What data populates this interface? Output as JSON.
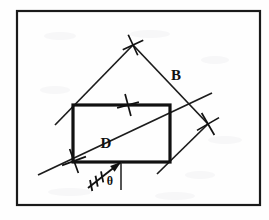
{
  "figure": {
    "background_color": "#fefefe",
    "ink_color": "#111111",
    "frame": {
      "name": "outer-border",
      "x": 17,
      "y": 11,
      "width": 243,
      "height": 194
    },
    "labels": [
      {
        "id": "B",
        "text": "B",
        "x": 176,
        "y": 80,
        "role": "diamond-side-label"
      },
      {
        "id": "D",
        "text": "D",
        "x": 106,
        "y": 148,
        "role": "rectangle-diagonal-label"
      },
      {
        "id": "theta",
        "text": "θ",
        "x": 110,
        "y": 185,
        "role": "angle-label"
      }
    ],
    "rectangle": {
      "name": "solid-rectangle",
      "x": 73,
      "y": 105,
      "width": 97,
      "height": 57,
      "stroke_width": 3.2
    },
    "diamond": {
      "name": "diamond-outline",
      "top_vertex": {
        "x": 133,
        "y": 45
      },
      "right_vertex": {
        "x": 208,
        "y": 124
      },
      "left_end": {
        "x": 55,
        "y": 125
      },
      "bottom_end": {
        "x": 157,
        "y": 174
      }
    },
    "diagonal": {
      "name": "rectangle-diagonal",
      "start": {
        "x": 38,
        "y": 175
      },
      "end": {
        "x": 212,
        "y": 93
      }
    },
    "x_marks": [
      {
        "id": "x-top",
        "x": 133,
        "y": 45,
        "size": 8,
        "angle": 20
      },
      {
        "id": "x-right",
        "x": 208,
        "y": 124,
        "size": 9,
        "angle": 15
      },
      {
        "id": "x-rect-top",
        "x": 128,
        "y": 105,
        "size": 8,
        "angle": 30
      },
      {
        "id": "x-rect-bottomleft",
        "x": 74,
        "y": 161,
        "size": 9,
        "angle": 25
      }
    ],
    "angle_marker": {
      "name": "theta-angle",
      "vertex": {
        "x": 121,
        "y": 162
      },
      "vertical_tick": {
        "x": 121,
        "y1": 162,
        "y2": 190
      },
      "arrow_tail": {
        "x": 88,
        "y": 188
      },
      "hatch_count": 3
    }
  }
}
